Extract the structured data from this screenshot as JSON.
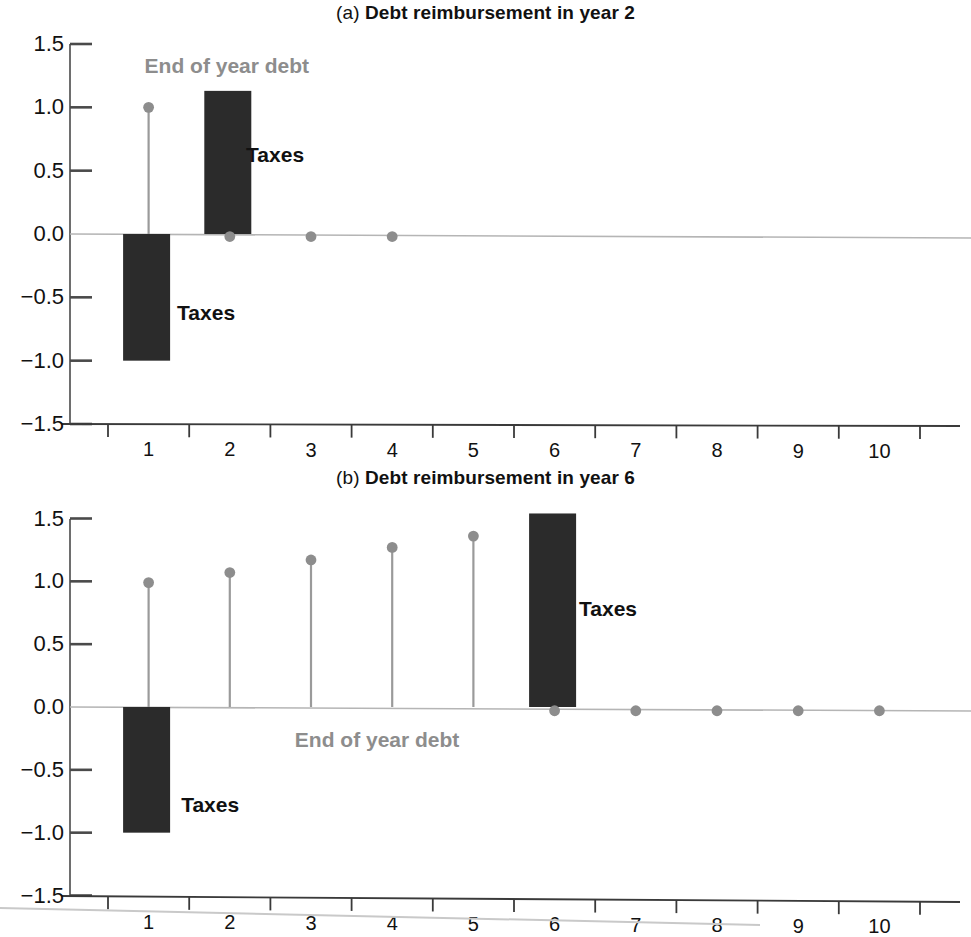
{
  "figure": {
    "background": "#ffffff",
    "bar_color": "#2b2b2b",
    "marker_color": "#8d8d8d",
    "stem_color": "#9a9a9a",
    "axis_color": "#4a4a4a",
    "zero_line_color": "#b5b5b5",
    "annotation_gray": "#8d8d8d"
  },
  "chart_data": [
    {
      "type": "bar",
      "panel": "a",
      "title_prefix": "(a)",
      "title": "Debt reimbursement in year 2",
      "xlabel": "",
      "ylabel": "",
      "ylim": [
        -1.5,
        1.5
      ],
      "xlim": [
        0.5,
        11.5
      ],
      "grid": false,
      "yticks": [
        "1.5",
        "1.0",
        "0.5",
        "0.0",
        "-0.5",
        "-1.0",
        "-1.5"
      ],
      "ytick_values": [
        1.5,
        1.0,
        0.5,
        0.0,
        -0.5,
        -1.0,
        -1.5
      ],
      "categories": [
        "1",
        "2",
        "3",
        "4",
        "5",
        "6",
        "7",
        "8",
        "9",
        "10"
      ],
      "series": [
        {
          "name": "Taxes",
          "kind": "bar",
          "x": [
            1,
            2
          ],
          "values": [
            -1.0,
            1.13
          ]
        },
        {
          "name": "End of year debt",
          "kind": "stem",
          "x": [
            1.5,
            2.5,
            3.5,
            4.5
          ],
          "values": [
            1.0,
            -0.02,
            -0.02,
            -0.02
          ]
        }
      ],
      "annotations": [
        {
          "text": "End of year debt",
          "style": "gray-bold",
          "x": 1.5,
          "y": 1.33
        },
        {
          "text": "Taxes",
          "style": "black-bold",
          "x": 2.75,
          "y": 0.62
        },
        {
          "text": "Taxes",
          "style": "black-bold",
          "x": 1.9,
          "y": -0.62
        }
      ]
    },
    {
      "type": "bar",
      "panel": "b",
      "title_prefix": "(b)",
      "title": "Debt reimbursement in year 6",
      "xlabel": "",
      "ylabel": "",
      "ylim": [
        -1.5,
        1.5
      ],
      "xlim": [
        0.5,
        11.5
      ],
      "grid": false,
      "yticks": [
        "1.5",
        "1.0",
        "0.5",
        "0.0",
        "-0.5",
        "-1.0",
        "-1.5"
      ],
      "ytick_values": [
        1.5,
        1.0,
        0.5,
        0.0,
        -0.5,
        -1.0,
        -1.5
      ],
      "categories": [
        "1",
        "2",
        "3",
        "4",
        "5",
        "6",
        "7",
        "8",
        "9",
        "10"
      ],
      "series": [
        {
          "name": "Taxes",
          "kind": "bar",
          "x": [
            1,
            6
          ],
          "values": [
            -1.0,
            1.54
          ]
        },
        {
          "name": "End of year debt",
          "kind": "stem",
          "x": [
            1.5,
            2.5,
            3.5,
            4.5,
            5.5,
            6.5,
            7.5,
            8.5,
            9.5,
            10.5
          ],
          "values": [
            0.99,
            1.07,
            1.17,
            1.27,
            1.36,
            -0.03,
            -0.03,
            -0.03,
            -0.03,
            -0.03
          ]
        }
      ],
      "annotations": [
        {
          "text": "Taxes",
          "style": "black-bold",
          "x": 6.85,
          "y": 0.78
        },
        {
          "text": "End of year debt",
          "style": "gray-bold",
          "x": 3.35,
          "y": -0.26
        },
        {
          "text": "Taxes",
          "style": "black-bold",
          "x": 1.95,
          "y": -0.78
        }
      ]
    }
  ]
}
